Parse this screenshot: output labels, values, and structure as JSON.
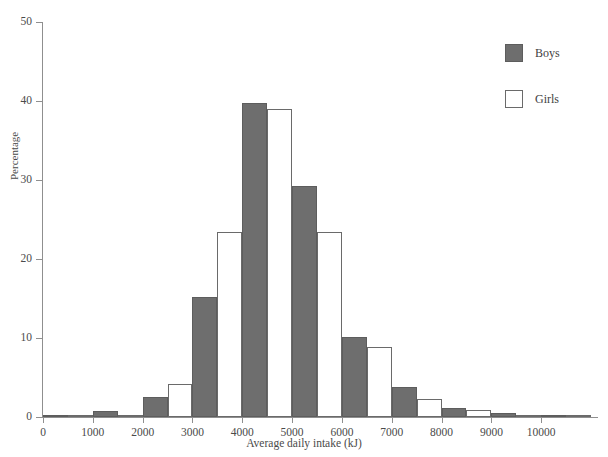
{
  "chart_data": {
    "type": "bar",
    "title": "",
    "xlabel": "Average daily intake (kJ)",
    "ylabel": "Percentage",
    "xlim": [
      0,
      11100
    ],
    "ylim": [
      0,
      50
    ],
    "xticks": [
      0,
      1000,
      2000,
      3000,
      4000,
      5000,
      6000,
      7000,
      8000,
      9000,
      10000
    ],
    "yticks": [
      0,
      10,
      20,
      30,
      40,
      50
    ],
    "grid": false,
    "legend_position": "top-right",
    "bin_width": 1000,
    "categories": [
      500,
      1500,
      2500,
      3500,
      4500,
      5500,
      6500,
      7500,
      8500,
      9500,
      10500
    ],
    "series": [
      {
        "name": "Boys",
        "color": "#6e6e6e",
        "values": [
          0.2,
          0.8,
          2.5,
          15.2,
          39.8,
          29.2,
          10.1,
          3.8,
          1.2,
          0.5,
          0.3
        ]
      },
      {
        "name": "Girls",
        "color": "#ffffff",
        "values": [
          0.2,
          0.3,
          4.2,
          23.4,
          39.0,
          23.4,
          8.9,
          2.3,
          0.9,
          0.3,
          0.2
        ]
      }
    ]
  },
  "axes": {
    "ytick_labels": [
      "0",
      "10",
      "20",
      "30",
      "40",
      "50"
    ],
    "xtick_labels": [
      "0",
      "1000",
      "2000",
      "3000",
      "4000",
      "5000",
      "6000",
      "7000",
      "8000",
      "9000",
      "10000"
    ],
    "ylabel": "Percentage",
    "xlabel": "Average daily intake (kJ)"
  },
  "legend": {
    "items": [
      {
        "label": "Boys",
        "style": "filled"
      },
      {
        "label": "Girls",
        "style": "outline"
      }
    ]
  },
  "colors": {
    "boys_fill": "#6e6e6e",
    "boys_border": "#5d5d5d",
    "girls_fill": "#ffffff",
    "girls_border": "#6a6a6a",
    "axis": "#8f8f8f",
    "text": "#3a3a3a",
    "background": "#ffffff"
  }
}
